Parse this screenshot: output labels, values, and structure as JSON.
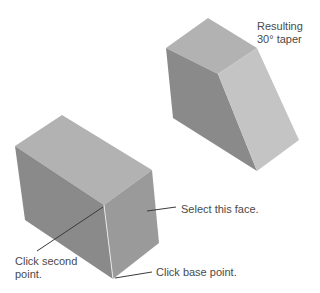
{
  "figure": {
    "colors": {
      "background": "#ffffff",
      "top_face": "#b2b2b2",
      "left_face": "#8a8a8a",
      "right_face_tapered": "#c4c4c4",
      "right_face_box": "#9a9a9a",
      "leader_line": "#3a3a3a",
      "label_text": "#4a4a4a"
    }
  },
  "tapered_block": {
    "top_face": [
      [
        208,
        18
      ],
      [
        257,
        48
      ],
      [
        218,
        74
      ],
      [
        166,
        48
      ]
    ],
    "left_face": [
      [
        166,
        48
      ],
      [
        218,
        74
      ],
      [
        257,
        171
      ],
      [
        173,
        118
      ]
    ],
    "right_face": [
      [
        218,
        74
      ],
      [
        257,
        48
      ],
      [
        299,
        140
      ],
      [
        257,
        171
      ]
    ]
  },
  "box_block": {
    "top_face": [
      [
        62,
        115
      ],
      [
        152,
        170
      ],
      [
        104,
        205
      ],
      [
        15,
        146
      ]
    ],
    "left_face": [
      [
        15,
        146
      ],
      [
        104,
        205
      ],
      [
        113,
        279
      ],
      [
        25,
        220
      ]
    ],
    "right_face": [
      [
        104,
        205
      ],
      [
        152,
        170
      ],
      [
        159,
        243
      ],
      [
        113,
        279
      ]
    ]
  },
  "annotations": {
    "result_line1": "Resulting",
    "result_line2": "30° taper",
    "select_face": "Select this face.",
    "second_point_line1": "Click second",
    "second_point_line2": "point.",
    "base_point": "Click base point."
  },
  "leaders": {
    "select_face": [
      [
        147,
        211
      ],
      [
        176,
        207
      ]
    ],
    "second_point": [
      [
        37,
        251
      ],
      [
        103,
        207
      ]
    ],
    "base_point": [
      [
        115,
        278
      ],
      [
        152,
        272
      ]
    ]
  }
}
